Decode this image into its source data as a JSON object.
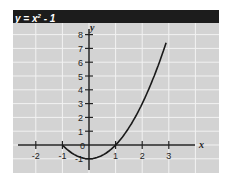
{
  "title": {
    "prefix": "y = x",
    "superscript": "2",
    "suffix": " - 1"
  },
  "chart_data": {
    "type": "line",
    "xlabel": "x",
    "ylabel": "y",
    "xlim": [
      -2.5,
      3.5
    ],
    "ylim": [
      -1.8,
      8.5
    ],
    "grid": true,
    "x_ticks": [
      -2,
      -1,
      1,
      2,
      3
    ],
    "y_ticks": [
      -1,
      1,
      2,
      3,
      4,
      5,
      6,
      7,
      8
    ],
    "origin_label": "0",
    "series": [
      {
        "name": "y = x² - 1",
        "x": [
          -1,
          -0.5,
          0,
          0.5,
          1,
          1.5,
          2,
          2.5,
          2.9
        ],
        "y": [
          0,
          -0.75,
          -1,
          -0.75,
          0,
          1.25,
          3,
          5.25,
          7.41
        ]
      }
    ]
  },
  "colors": {
    "background": "#d3d3d3",
    "grid": "#f2f2f2",
    "title_bar": "#1c1c1c",
    "curve": "#1a1a1a"
  }
}
